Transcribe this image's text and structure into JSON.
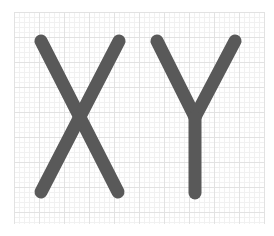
{
  "figure": {
    "text": "XY",
    "letters": [
      {
        "char": "X",
        "strokes": [
          {
            "x1": 41,
            "y1": 41,
            "x2": 118,
            "y2": 192
          },
          {
            "x1": 119,
            "y1": 41,
            "x2": 41,
            "y2": 192
          }
        ]
      },
      {
        "char": "Y",
        "strokes": [
          {
            "x1": 157,
            "y1": 41,
            "x2": 195,
            "y2": 117
          },
          {
            "x1": 235,
            "y1": 41,
            "x2": 195,
            "y2": 117
          },
          {
            "x1": 195,
            "y1": 117,
            "x2": 195,
            "y2": 193
          }
        ]
      }
    ],
    "stroke_color": "#595959",
    "stroke_width": 13
  },
  "grid": {
    "x": 14,
    "y": 12,
    "width": 250,
    "height": 212,
    "minor_spacing": 5,
    "major_spacing": 25,
    "minor_color": "#f1f1f1",
    "major_color": "#e2e2e2",
    "background": "#ffffff"
  }
}
